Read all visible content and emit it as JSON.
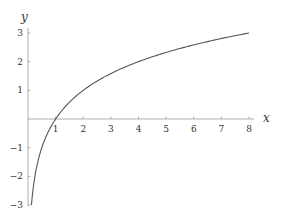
{
  "chart_data": {
    "type": "line",
    "title": "",
    "xlabel": "x",
    "ylabel": "y",
    "function": "y = log2(x)",
    "xlim": [
      0,
      8
    ],
    "ylim": [
      -3,
      3
    ],
    "grid": false,
    "legend": null,
    "x_ticks": [
      1,
      2,
      3,
      4,
      5,
      6,
      7,
      8
    ],
    "y_ticks": [
      -3,
      -2,
      -1,
      1,
      2,
      3
    ],
    "series": [
      {
        "name": "log2(x)",
        "color": "#555555",
        "x": [
          0.125,
          0.25,
          0.5,
          1,
          2,
          3,
          4,
          5,
          6,
          7,
          8
        ],
        "y": [
          -3,
          -2,
          -1,
          0,
          1,
          1.585,
          2,
          2.322,
          2.585,
          2.807,
          3
        ]
      }
    ]
  },
  "colors": {
    "axis": "#999999",
    "curve": "#555555",
    "text": "#333333"
  }
}
